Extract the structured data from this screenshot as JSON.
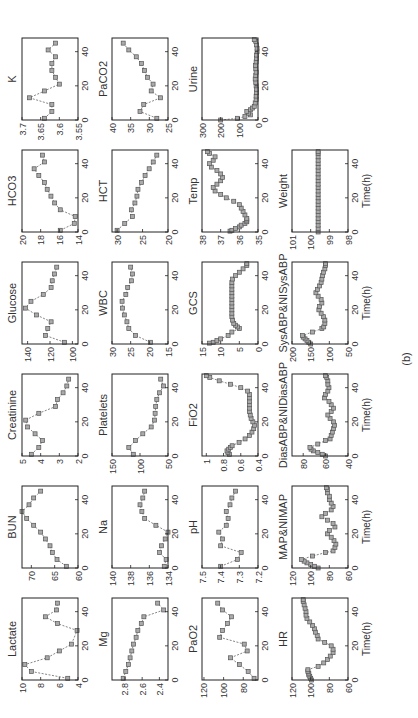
{
  "caption": "(b)",
  "xlabel": "Time(h)",
  "chart_data": {
    "type": "line",
    "x_ticks": [
      0,
      20,
      40
    ],
    "xlim": [
      0,
      48
    ],
    "grid": false,
    "panels": [
      {
        "name": "Lactate",
        "row": 0,
        "col": 0,
        "ylim": [
          4,
          10
        ],
        "yticks": [
          "4",
          "6",
          "8",
          "10"
        ],
        "x": [
          1,
          5,
          9,
          13,
          17,
          21,
          29,
          33,
          37,
          41,
          45
        ],
        "y": [
          5.1,
          9,
          9.7,
          7.3,
          6,
          4.7,
          4.1,
          6.2,
          7.5,
          6.3,
          6.2
        ]
      },
      {
        "name": "BUN",
        "row": 0,
        "col": 1,
        "ylim": [
          60,
          72
        ],
        "yticks": [
          "60",
          "65",
          "70"
        ],
        "x": [
          1,
          5,
          9,
          13,
          17,
          21,
          25,
          29,
          33,
          37,
          41,
          45
        ],
        "y": [
          62.5,
          64.5,
          65.5,
          66,
          67,
          68,
          69.5,
          71,
          72,
          70.5,
          69.5,
          68
        ]
      },
      {
        "name": "Creatinine",
        "row": 0,
        "col": 2,
        "ylim": [
          2,
          5
        ],
        "yticks": [
          "2",
          "3",
          "4",
          "5"
        ],
        "x": [
          1,
          5,
          9,
          13,
          17,
          21,
          25,
          29,
          33,
          37,
          41,
          45
        ],
        "y": [
          4.5,
          4.1,
          3.9,
          4.3,
          4.7,
          4.8,
          4.1,
          3.2,
          3.1,
          2.8,
          2.6,
          2.5
        ]
      },
      {
        "name": "Glucose",
        "row": 0,
        "col": 3,
        "ylim": [
          95,
          145
        ],
        "yticks": [
          "100",
          "120",
          "140"
        ],
        "x": [
          1,
          5,
          9,
          13,
          17,
          21,
          25,
          29,
          33,
          37,
          41,
          45
        ],
        "y": [
          107,
          124,
          122,
          119,
          132,
          142,
          137,
          126,
          119,
          118,
          116,
          114
        ]
      },
      {
        "name": "HCO3",
        "row": 0,
        "col": 4,
        "ylim": [
          14,
          20
        ],
        "yticks": [
          "14",
          "16",
          "18",
          "20"
        ],
        "x": [
          1,
          5,
          9,
          13,
          17,
          21,
          25,
          29,
          33,
          37,
          41,
          45
        ],
        "y": [
          15.9,
          14.4,
          14.3,
          15.9,
          16.5,
          16.9,
          17.3,
          17.6,
          18.2,
          18.7,
          17.6,
          17.8
        ]
      },
      {
        "name": "K",
        "row": 0,
        "col": 5,
        "ylim": [
          3.55,
          3.7
        ],
        "yticks": [
          "3.55",
          "3.6",
          "3.65",
          "3.7"
        ],
        "x": [
          1,
          5,
          9,
          13,
          17,
          21,
          25,
          29,
          33,
          37,
          41,
          45
        ],
        "y": [
          3.64,
          3.62,
          3.62,
          3.68,
          3.64,
          3.6,
          3.61,
          3.62,
          3.62,
          3.61,
          3.63,
          3.61
        ]
      },
      {
        "name": "Mg",
        "row": 1,
        "col": 0,
        "ylim": [
          2.3,
          2.95
        ],
        "yticks": [
          "2.4",
          "2.6",
          "2.8"
        ],
        "x": [
          1,
          5,
          9,
          13,
          17,
          21,
          25,
          29,
          33,
          37,
          41,
          45
        ],
        "y": [
          2.82,
          2.79,
          2.76,
          2.74,
          2.72,
          2.7,
          2.67,
          2.65,
          2.61,
          2.58,
          2.35,
          2.42
        ]
      },
      {
        "name": "Na",
        "row": 1,
        "col": 1,
        "ylim": [
          134,
          140
        ],
        "yticks": [
          "134",
          "136",
          "138",
          "140"
        ],
        "x": [
          1,
          5,
          9,
          13,
          17,
          21,
          25,
          29,
          33,
          37,
          41,
          45
        ],
        "y": [
          134.4,
          134.2,
          134.9,
          134.7,
          134.3,
          134,
          135.3,
          136.5,
          136.8,
          137,
          136.7,
          136.5
        ]
      },
      {
        "name": "Platelets",
        "row": 1,
        "col": 2,
        "ylim": [
          50,
          150
        ],
        "yticks": [
          "50",
          "100",
          "150"
        ],
        "x": [
          1,
          5,
          9,
          13,
          17,
          21,
          25,
          29,
          33,
          37,
          41,
          45
        ],
        "y": [
          112,
          120,
          108,
          95,
          80,
          74,
          73,
          72,
          70,
          65,
          58,
          63
        ]
      },
      {
        "name": "WBC",
        "row": 1,
        "col": 3,
        "ylim": [
          15,
          30
        ],
        "yticks": [
          "15",
          "20",
          "25",
          "30"
        ],
        "x": [
          1,
          5,
          9,
          13,
          17,
          21,
          25,
          29,
          33,
          37,
          41,
          45
        ],
        "y": [
          19.7,
          23.7,
          25.5,
          26,
          26.7,
          27.2,
          27.3,
          26.3,
          25.8,
          24.8,
          24.5,
          25
        ]
      },
      {
        "name": "HCT",
        "row": 1,
        "col": 4,
        "ylim": [
          20,
          31
        ],
        "yticks": [
          "20",
          "25",
          "30"
        ],
        "x": [
          1,
          5,
          9,
          13,
          17,
          21,
          25,
          29,
          33,
          37,
          41,
          45
        ],
        "y": [
          30,
          28.5,
          27,
          27.2,
          26.5,
          26.1,
          25.9,
          25.2,
          24.5,
          23.7,
          22.9,
          22.2
        ]
      },
      {
        "name": "PaCO2",
        "row": 1,
        "col": 5,
        "ylim": [
          25,
          40
        ],
        "yticks": [
          "25",
          "30",
          "35",
          "40"
        ],
        "x": [
          1,
          5,
          9,
          13,
          17,
          21,
          25,
          29,
          33,
          37,
          41,
          45
        ],
        "y": [
          28,
          32.5,
          31.5,
          27,
          29.5,
          29,
          30.5,
          31.3,
          32.1,
          33.5,
          35.5,
          37
        ]
      },
      {
        "name": "PaO2",
        "row": 2,
        "col": 0,
        "ylim": [
          65,
          122
        ],
        "yticks": [
          "80",
          "100",
          "120"
        ],
        "x": [
          1,
          5,
          9,
          13,
          17,
          21,
          25,
          29,
          33,
          37,
          41,
          45
        ],
        "y": [
          69,
          75,
          84,
          93,
          76,
          79,
          104,
          101,
          96,
          92,
          101,
          106
        ]
      },
      {
        "name": "pH",
        "row": 2,
        "col": 1,
        "ylim": [
          7.2,
          7.5
        ],
        "yticks": [
          "7.2",
          "7.3",
          "7.4",
          "7.5"
        ],
        "x": [
          1,
          5,
          9,
          13,
          17,
          21,
          25,
          29,
          33,
          37,
          41,
          45
        ],
        "y": [
          7.4,
          7.31,
          7.29,
          7.4,
          7.39,
          7.41,
          7.37,
          7.36,
          7.37,
          7.35,
          7.34,
          7.32
        ]
      },
      {
        "name": "FiO2",
        "row": 2,
        "col": 2,
        "ylim": [
          0.4,
          1.05
        ],
        "yticks": [
          "0.4",
          "0.6",
          "0.8",
          "1"
        ],
        "x": [
          1,
          2,
          3,
          4,
          5,
          6,
          8,
          10,
          12,
          14,
          16,
          18,
          20,
          22,
          24,
          26,
          28,
          30,
          32,
          34,
          36,
          38,
          40,
          42,
          44,
          46,
          47
        ],
        "y": [
          0.73,
          0.75,
          0.76,
          0.74,
          0.72,
          0.7,
          0.62,
          0.55,
          0.5,
          0.47,
          0.45,
          0.44,
          0.46,
          0.48,
          0.49,
          0.5,
          0.5,
          0.5,
          0.5,
          0.5,
          0.5,
          0.52,
          0.6,
          0.72,
          0.85,
          0.96,
          1.0
        ]
      },
      {
        "name": "GCS",
        "row": 2,
        "col": 3,
        "ylim": [
          0,
          15
        ],
        "yticks": [
          "0",
          "5",
          "10",
          "15"
        ],
        "x": [
          0.5,
          1,
          2,
          3,
          5,
          7,
          9,
          10,
          11,
          12,
          14,
          16,
          18,
          20,
          22,
          24,
          26,
          28,
          30,
          32,
          34,
          36,
          38,
          40,
          42,
          44,
          46,
          47
        ],
        "y": [
          13,
          12,
          11,
          10,
          8,
          7,
          5,
          5.5,
          6,
          6.5,
          6.8,
          7,
          7,
          7,
          7,
          7,
          7,
          7,
          7,
          7,
          7,
          7,
          6.8,
          6,
          5,
          4,
          3,
          3
        ]
      },
      {
        "name": "Temp",
        "row": 2,
        "col": 4,
        "ylim": [
          35,
          38
        ],
        "yticks": [
          "35",
          "36",
          "37",
          "38"
        ],
        "x": [
          0.5,
          1,
          2,
          3,
          4,
          5,
          6,
          7,
          8,
          10,
          12,
          14,
          16,
          18,
          20,
          22,
          24,
          26,
          28,
          30,
          32,
          34,
          36,
          38,
          40,
          42,
          44,
          46,
          47
        ],
        "y": [
          36.5,
          36.4,
          36.2,
          36,
          35.9,
          35.7,
          35.6,
          35.6,
          35.6,
          35.7,
          35.8,
          35.9,
          36,
          36.3,
          36.7,
          37,
          37.3,
          37.4,
          37.2,
          37,
          36.9,
          37,
          37.2,
          37.5,
          37.6,
          37.4,
          37.3,
          37.6,
          37.7
        ]
      },
      {
        "name": "Urine",
        "row": 2,
        "col": 5,
        "ylim": [
          0,
          300
        ],
        "yticks": [
          "0",
          "100",
          "200",
          "300"
        ],
        "x": [
          0,
          1,
          2,
          3,
          4,
          5,
          6,
          7,
          8,
          10,
          12,
          14,
          16,
          18,
          20,
          22,
          24,
          26,
          28,
          30,
          32,
          34,
          36,
          38,
          40,
          42,
          44,
          46,
          47
        ],
        "y": [
          200,
          110,
          70,
          40,
          50,
          60,
          40,
          30,
          20,
          15,
          10,
          10,
          8,
          8,
          10,
          12,
          15,
          12,
          10,
          12,
          14,
          10,
          8,
          8,
          5,
          5,
          8,
          12,
          20
        ]
      },
      {
        "name": "HR",
        "row": 3,
        "col": 0,
        "ylim": [
          60,
          120
        ],
        "yticks": [
          "60",
          "80",
          "100",
          "120"
        ],
        "x": [
          0,
          1,
          2,
          3,
          4,
          5,
          6,
          8,
          10,
          12,
          14,
          16,
          18,
          20,
          22,
          24,
          26,
          28,
          30,
          32,
          34,
          36,
          38,
          40,
          42,
          44,
          46,
          47
        ],
        "y": [
          99,
          100,
          101,
          102,
          102,
          103,
          103,
          92,
          86,
          82,
          79,
          76,
          76,
          78,
          85,
          92,
          93,
          95,
          96,
          98,
          101,
          104,
          105,
          105,
          106,
          107,
          108,
          108
        ]
      },
      {
        "name": "MAP&NIMAP",
        "row": 3,
        "col": 1,
        "ylim": [
          60,
          120
        ],
        "yticks": [
          "60",
          "80",
          "100",
          "120"
        ],
        "x": [
          0,
          1,
          2,
          3,
          4,
          5,
          7,
          9,
          10,
          12,
          14,
          16,
          18,
          20,
          22,
          24,
          26,
          28,
          30,
          32,
          34,
          36,
          38,
          40,
          42,
          44,
          46,
          47
        ],
        "y": [
          92,
          96,
          100,
          104,
          107,
          110,
          98,
          84,
          76,
          74,
          73,
          75,
          78,
          82,
          80,
          74,
          76,
          82,
          88,
          84,
          78,
          76,
          78,
          80,
          80,
          82,
          82,
          83
        ]
      },
      {
        "name": "DiasABP&NIDiasABP",
        "row": 3,
        "col": 2,
        "ylim": [
          40,
          90
        ],
        "yticks": [
          "40",
          "60",
          "80"
        ],
        "x": [
          0,
          1,
          2,
          3,
          4,
          5,
          7,
          9,
          10,
          12,
          14,
          16,
          18,
          20,
          22,
          24,
          26,
          28,
          30,
          32,
          34,
          36,
          38,
          40,
          42,
          44,
          46,
          47
        ],
        "y": [
          60,
          63,
          67,
          71,
          73,
          74,
          67,
          60,
          56,
          55,
          54,
          53,
          52,
          53,
          56,
          58,
          55,
          53,
          55,
          57,
          61,
          60,
          58,
          57,
          58,
          58,
          59,
          60
        ]
      },
      {
        "name": "SysABP&NISysABP",
        "row": 3,
        "col": 3,
        "ylim": [
          50,
          200
        ],
        "yticks": [
          "50",
          "100",
          "150",
          "200"
        ],
        "x": [
          0,
          1,
          2,
          3,
          4,
          5,
          7,
          9,
          10,
          12,
          14,
          16,
          18,
          20,
          22,
          24,
          26,
          28,
          30,
          32,
          34,
          36,
          38,
          40,
          42,
          44,
          46,
          47
        ],
        "y": [
          150,
          155,
          160,
          165,
          170,
          172,
          145,
          120,
          115,
          112,
          112,
          116,
          122,
          128,
          126,
          120,
          122,
          130,
          136,
          132,
          126,
          122,
          120,
          118,
          116,
          112,
          110,
          110
        ]
      },
      {
        "name": "Weight",
        "row": 3,
        "col": 4,
        "ylim": [
          98,
          101
        ],
        "yticks": [
          "98",
          "99",
          "100",
          "101"
        ],
        "x": [
          0,
          2,
          4,
          6,
          8,
          10,
          12,
          14,
          16,
          18,
          20,
          22,
          24,
          26,
          28,
          30,
          32,
          34,
          36,
          38,
          40,
          42,
          44,
          46,
          47
        ],
        "y": [
          99.6,
          99.6,
          99.6,
          99.6,
          99.6,
          99.6,
          99.6,
          99.6,
          99.6,
          99.6,
          99.6,
          99.6,
          99.6,
          99.6,
          99.6,
          99.6,
          99.6,
          99.6,
          99.6,
          99.6,
          99.6,
          99.6,
          99.6,
          99.6,
          99.6
        ]
      }
    ]
  }
}
